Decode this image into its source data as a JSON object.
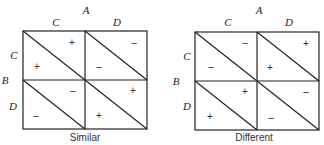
{
  "diagrams": [
    {
      "caption": "Similar",
      "top_factor": "A",
      "side_factor": "B",
      "columns": [
        "C",
        "D"
      ],
      "rows": [
        "C",
        "D"
      ],
      "cells": [
        {
          "row": "C",
          "col": "C",
          "upper": "+",
          "lower": "+"
        },
        {
          "row": "C",
          "col": "D",
          "upper": "–",
          "lower": "–"
        },
        {
          "row": "D",
          "col": "C",
          "upper": "–",
          "lower": "–"
        },
        {
          "row": "D",
          "col": "D",
          "upper": "+",
          "lower": "+"
        }
      ]
    },
    {
      "caption": "Different",
      "top_factor": "A",
      "side_factor": "B",
      "columns": [
        "C",
        "D"
      ],
      "rows": [
        "C",
        "D"
      ],
      "cells": [
        {
          "row": "C",
          "col": "C",
          "upper": "–",
          "lower": "–"
        },
        {
          "row": "C",
          "col": "D",
          "upper": "+",
          "lower": "+"
        },
        {
          "row": "D",
          "col": "C",
          "upper": "+",
          "lower": "+"
        },
        {
          "row": "D",
          "col": "D",
          "upper": "–",
          "lower": "–"
        }
      ]
    }
  ]
}
